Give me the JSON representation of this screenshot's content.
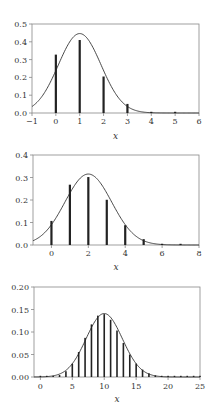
{
  "chart_data": [
    {
      "type": "bar",
      "title": "",
      "xlabel": "x",
      "ylabel": "",
      "xlim": [
        -1,
        6
      ],
      "ylim": [
        0,
        0.5
      ],
      "xticks": [
        -1,
        0,
        1,
        2,
        3,
        4,
        5,
        6
      ],
      "yticks": [
        "0.0",
        "0.1",
        "0.2",
        "0.3",
        "0.4",
        "0.5"
      ],
      "grid": false,
      "series": [
        {
          "name": "probability mass (stems)",
          "kind": "stem",
          "x": [
            0,
            1,
            2,
            3,
            4,
            5
          ],
          "values": [
            0.328,
            0.41,
            0.205,
            0.051,
            0.006,
            0.0003
          ]
        },
        {
          "name": "normal approximation curve",
          "kind": "line",
          "mean": 1,
          "sd": 0.894
        }
      ]
    },
    {
      "type": "bar",
      "title": "",
      "xlabel": "x",
      "ylabel": "",
      "xlim": [
        -1,
        8
      ],
      "ylim": [
        0,
        0.4
      ],
      "xticks": [
        0,
        2,
        4,
        6,
        8
      ],
      "yticks": [
        "0.0",
        "0.1",
        "0.2",
        "0.3",
        "0.4"
      ],
      "grid": false,
      "series": [
        {
          "name": "probability mass (stems)",
          "kind": "stem",
          "x": [
            0,
            1,
            2,
            3,
            4,
            5,
            6,
            7
          ],
          "values": [
            0.107,
            0.268,
            0.302,
            0.201,
            0.088,
            0.026,
            0.0055,
            0.0008
          ]
        },
        {
          "name": "normal approximation curve",
          "kind": "line",
          "mean": 2,
          "sd": 1.265
        }
      ]
    },
    {
      "type": "bar",
      "title": "",
      "xlabel": "x",
      "ylabel": "",
      "xlim": [
        -1,
        25
      ],
      "ylim": [
        0,
        0.2
      ],
      "xticks": [
        0,
        5,
        10,
        15,
        20,
        25
      ],
      "yticks": [
        "0.00",
        "0.05",
        "0.10",
        "0.15",
        "0.20"
      ],
      "grid": false,
      "series": [
        {
          "name": "probability mass (stems)",
          "kind": "stem",
          "x": [
            0,
            1,
            2,
            3,
            4,
            5,
            6,
            7,
            8,
            9,
            10,
            11,
            12,
            13,
            14,
            15,
            16,
            17,
            18,
            19,
            20,
            21,
            22,
            23,
            24,
            25
          ],
          "values": [
            0.0,
            0.0002,
            0.0011,
            0.0044,
            0.0128,
            0.0295,
            0.0554,
            0.087,
            0.1169,
            0.1364,
            0.1398,
            0.1271,
            0.1033,
            0.0755,
            0.0499,
            0.0299,
            0.0164,
            0.0082,
            0.0037,
            0.0016,
            0.0006,
            0.0002,
            0.0001,
            0.0,
            0.0,
            0.0
          ]
        },
        {
          "name": "normal approximation curve",
          "kind": "line",
          "mean": 10,
          "sd": 2.828
        }
      ]
    }
  ],
  "panels": [
    {
      "xlabel": "x",
      "xticks": [
        "−1",
        "0",
        "1",
        "2",
        "3",
        "4",
        "5",
        "6"
      ],
      "yticks": [
        "0.0",
        "0.1",
        "0.2",
        "0.3",
        "0.4",
        "0.5"
      ]
    },
    {
      "xlabel": "x",
      "xticks": [
        "0",
        "2",
        "4",
        "6",
        "8"
      ],
      "yticks": [
        "0.0",
        "0.1",
        "0.2",
        "0.3",
        "0.4"
      ]
    },
    {
      "xlabel": "x",
      "xticks": [
        "0",
        "5",
        "10",
        "15",
        "20",
        "25"
      ],
      "yticks": [
        "0.00",
        "0.05",
        "0.10",
        "0.15",
        "0.20"
      ]
    }
  ],
  "colors": {
    "axis": "#888888",
    "stem": "#222222",
    "curve": "#333333",
    "text": "#333333"
  }
}
